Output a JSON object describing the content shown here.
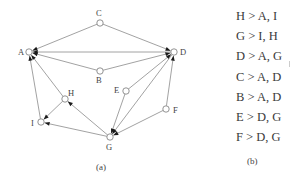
{
  "figure": {
    "panel_a": {
      "caption": "(a)",
      "nodes": [
        {
          "id": "A",
          "x": 29,
          "y": 52,
          "lx": 18,
          "ly": 55
        },
        {
          "id": "B",
          "x": 100,
          "y": 71,
          "lx": 96,
          "ly": 83
        },
        {
          "id": "C",
          "x": 100,
          "y": 23,
          "lx": 96,
          "ly": 16
        },
        {
          "id": "D",
          "x": 174,
          "y": 52,
          "lx": 180,
          "ly": 55
        },
        {
          "id": "E",
          "x": 126,
          "y": 91,
          "lx": 114,
          "ly": 93
        },
        {
          "id": "F",
          "x": 166,
          "y": 109,
          "lx": 173,
          "ly": 113
        },
        {
          "id": "G",
          "x": 110,
          "y": 137,
          "lx": 106,
          "ly": 150
        },
        {
          "id": "H",
          "x": 65,
          "y": 99,
          "lx": 68,
          "ly": 96
        },
        {
          "id": "I",
          "x": 41,
          "y": 122,
          "lx": 31,
          "ly": 126
        }
      ],
      "edges": [
        {
          "from": "H",
          "to": "A"
        },
        {
          "from": "H",
          "to": "I"
        },
        {
          "from": "G",
          "to": "I"
        },
        {
          "from": "G",
          "to": "H"
        },
        {
          "from": "D",
          "to": "A"
        },
        {
          "from": "D",
          "to": "G"
        },
        {
          "from": "C",
          "to": "A"
        },
        {
          "from": "C",
          "to": "D"
        },
        {
          "from": "B",
          "to": "A"
        },
        {
          "from": "B",
          "to": "D"
        },
        {
          "from": "E",
          "to": "D"
        },
        {
          "from": "E",
          "to": "G"
        },
        {
          "from": "F",
          "to": "D"
        },
        {
          "from": "F",
          "to": "G"
        },
        {
          "from": "I",
          "to": "A"
        }
      ]
    },
    "panel_b": {
      "caption": "(b)",
      "rules": [
        "H > A, I",
        "G > I, H",
        "D > A, G",
        "C > A, D",
        "B > A, D",
        "E > D, G",
        "F > D, G"
      ]
    },
    "colors": {
      "edge": "#8a8a8a",
      "arrow": "#222222",
      "node_stroke": "#777777"
    }
  }
}
